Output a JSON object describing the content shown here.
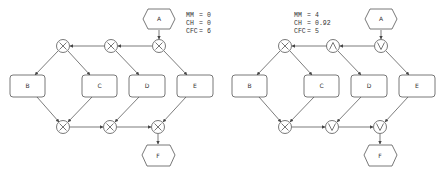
{
  "diagrams": [
    {
      "id": "left",
      "metrics": [
        {
          "name": "MM",
          "value": "0"
        },
        {
          "name": "CH",
          "value": "0"
        },
        {
          "name": "CFC",
          "value": "6"
        }
      ],
      "nodes": {
        "A": "A",
        "B": "B",
        "C": "C",
        "D": "D",
        "E": "E",
        "F": "F"
      },
      "gateways": {
        "split1": "XOR",
        "split2": "XOR",
        "split3": "XOR",
        "join1": "XOR",
        "join2": "XOR",
        "join3": "XOR"
      }
    },
    {
      "id": "right",
      "metrics": [
        {
          "name": "MM",
          "value": "4"
        },
        {
          "name": "CH",
          "value": "0.92"
        },
        {
          "name": "CFC",
          "value": "5"
        }
      ],
      "nodes": {
        "A": "A",
        "B": "B",
        "C": "C",
        "D": "D",
        "E": "E",
        "F": "F"
      },
      "gateways": {
        "split1": "XOR",
        "split2": "AND",
        "split3": "OR",
        "join1": "XOR",
        "join2": "OR",
        "join3": "OR"
      }
    }
  ]
}
